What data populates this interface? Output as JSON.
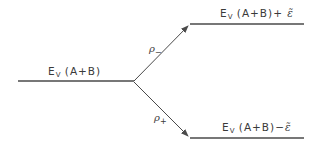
{
  "diagram": {
    "type": "energy-level-splitting",
    "levels": {
      "initial": {
        "symbol": "E",
        "subscript": "V",
        "argument": "(A+B)",
        "shift": ""
      },
      "upper": {
        "symbol": "E",
        "subscript": "V",
        "argument": "(A+B)",
        "operator": "+",
        "shift": "ε̃"
      },
      "lower": {
        "symbol": "E",
        "subscript": "V",
        "argument": "(A+B)",
        "operator": "−",
        "shift": "ε̃"
      }
    },
    "transitions": {
      "to_upper": {
        "symbol": "ρ",
        "subscript": "−"
      },
      "to_lower": {
        "symbol": "ρ",
        "subscript": "+"
      }
    },
    "colors": {
      "line": "#4a4a4a",
      "text": "#3a3a3a",
      "background": "#ffffff"
    }
  }
}
